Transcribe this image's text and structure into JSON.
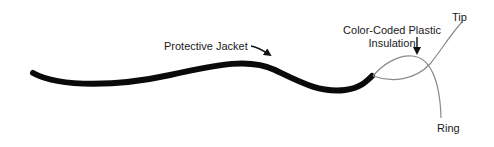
{
  "diagram": {
    "type": "cable-cross-section-illustration",
    "labels": {
      "jacket": "Protective Jacket",
      "insulation_line1": "Color-Coded Plastic",
      "insulation_line2": "Insulation",
      "tip": "Tip",
      "ring": "Ring"
    },
    "colors": {
      "jacket": "#0a0a0a",
      "wire": "#8a8a8a",
      "text": "#1a1a1a",
      "arrow": "#111111",
      "background": "#ffffff"
    }
  }
}
